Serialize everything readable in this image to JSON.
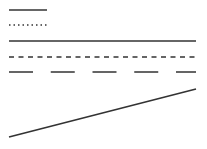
{
  "stroke_color": "#333333",
  "background": "#ffffff",
  "line_styles": [
    {
      "name": "solid-short",
      "style": "solid"
    },
    {
      "name": "dotted-short",
      "style": "dotted"
    },
    {
      "name": "solid-long",
      "style": "solid"
    },
    {
      "name": "dashed-long",
      "style": "dashed"
    },
    {
      "name": "long-dashed-long",
      "style": "long-dash"
    },
    {
      "name": "diagonal",
      "style": "solid"
    }
  ]
}
